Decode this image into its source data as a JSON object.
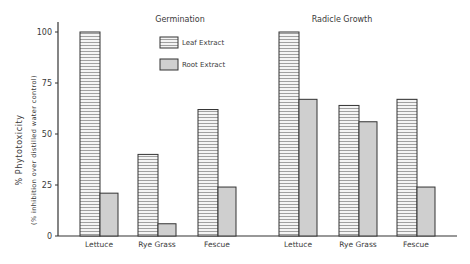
{
  "chart_data": {
    "type": "bar",
    "ylabel": "% Phytotoxicity",
    "ylabel_sub": "(% inhibition over distilled water control)",
    "yticks": [
      "0",
      "25",
      "50",
      "75",
      "100"
    ],
    "ylim": [
      0,
      100
    ],
    "grid": false,
    "legend": {
      "position": "top-center",
      "entries": [
        "Leaf Extract",
        "Root Extract"
      ]
    },
    "panels": [
      {
        "title": "Germination",
        "categories": [
          "Lettuce",
          "Rye Grass",
          "Fescue"
        ],
        "series": [
          {
            "name": "Leaf Extract",
            "values": [
              100,
              40,
              62
            ]
          },
          {
            "name": "Root Extract",
            "values": [
              21,
              6,
              24
            ]
          }
        ]
      },
      {
        "title": "Radicle Growth",
        "categories": [
          "Lettuce",
          "Rye Grass",
          "Fescue"
        ],
        "series": [
          {
            "name": "Leaf Extract",
            "values": [
              100,
              64,
              67
            ]
          },
          {
            "name": "Root Extract",
            "values": [
              67,
              56,
              24
            ]
          }
        ]
      }
    ]
  },
  "colors": {
    "leaf_fill": "#f2f2f2",
    "leaf_stripe": "#7a7a7a",
    "root_fill": "#cfcfcf",
    "outline": "#333333"
  }
}
